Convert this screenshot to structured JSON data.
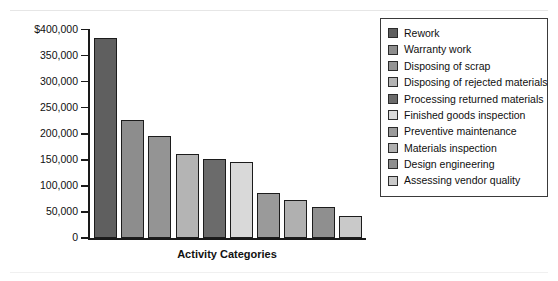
{
  "chart_data": {
    "type": "bar",
    "title": "",
    "xlabel": "Activity Categories",
    "ylabel": "",
    "ylim": [
      0,
      400000
    ],
    "grid": false,
    "legend_position": "right",
    "ytick_labels": [
      "$400,000",
      "350,000",
      "300,000",
      "250,000",
      "200,000",
      "150,000",
      "100,000",
      "50,000",
      "0"
    ],
    "ytick_values": [
      400000,
      350000,
      300000,
      250000,
      200000,
      150000,
      100000,
      50000,
      0
    ],
    "categories": [
      "Rework",
      "Warranty work",
      "Disposing of scrap",
      "Disposing of rejected materials",
      "Processing returned materials",
      "Finished goods inspection",
      "Preventive maintenance",
      "Materials inspection",
      "Design engineering",
      "Assessing vendor quality"
    ],
    "values": [
      383000,
      226000,
      196000,
      161000,
      152000,
      146000,
      87000,
      73000,
      60000,
      43000
    ],
    "colors": [
      "#5f5f5f",
      "#8d8d8d",
      "#949494",
      "#b4b4b4",
      "#6b6b6b",
      "#d9d9d9",
      "#9a9a9a",
      "#b0b0b0",
      "#8f8f8f",
      "#c9c9c9"
    ]
  },
  "legend": {
    "items": [
      {
        "label": "Rework",
        "color": "#5f5f5f"
      },
      {
        "label": "Warranty work",
        "color": "#8d8d8d"
      },
      {
        "label": "Disposing of scrap",
        "color": "#949494"
      },
      {
        "label": "Disposing of rejected materials",
        "color": "#b4b4b4"
      },
      {
        "label": "Processing returned materials",
        "color": "#6b6b6b"
      },
      {
        "label": "Finished goods inspection",
        "color": "#d9d9d9"
      },
      {
        "label": "Preventive maintenance",
        "color": "#9a9a9a"
      },
      {
        "label": "Materials inspection",
        "color": "#b0b0b0"
      },
      {
        "label": "Design engineering",
        "color": "#8f8f8f"
      },
      {
        "label": "Assessing vendor quality",
        "color": "#c9c9c9"
      }
    ]
  }
}
